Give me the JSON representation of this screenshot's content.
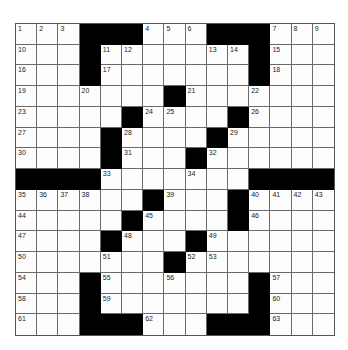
{
  "puzzle": {
    "rows": 15,
    "cols": 15,
    "block_color": "#000000",
    "cell_color": "#fdfdfd",
    "grid": [
      [
        "1",
        "2",
        "3",
        "#",
        "#",
        "#",
        "4",
        "5",
        "6",
        "#",
        "#",
        "#",
        "7",
        "8",
        "9"
      ],
      [
        "10",
        "",
        "",
        "#",
        "11",
        "12",
        "",
        "",
        "",
        "13",
        "14",
        "#",
        "15",
        "",
        ""
      ],
      [
        "16",
        "",
        "",
        "#",
        "17",
        "",
        "",
        "",
        "",
        "",
        "",
        "#",
        "18",
        "",
        ""
      ],
      [
        "19",
        "",
        "",
        "20",
        "",
        "",
        "",
        "#",
        "21",
        "",
        "",
        "22",
        "",
        "",
        ""
      ],
      [
        "23",
        "",
        "",
        "",
        "",
        "#",
        "24",
        "25",
        "",
        "",
        "#",
        "26",
        "",
        "",
        ""
      ],
      [
        "27",
        "",
        "",
        "",
        "#",
        "28",
        "",
        "",
        "",
        "#",
        "29",
        "",
        "",
        "",
        ""
      ],
      [
        "30",
        "",
        "",
        "",
        "#",
        "31",
        "",
        "",
        "#",
        "32",
        "",
        "",
        "",
        "",
        ""
      ],
      [
        "#",
        "#",
        "#",
        "#",
        "33",
        "",
        "",
        "",
        "34",
        "",
        "",
        "#",
        "#",
        "#",
        "#"
      ],
      [
        "35",
        "36",
        "37",
        "38",
        "",
        "",
        "#",
        "39",
        "",
        "",
        "#",
        "40",
        "41",
        "42",
        "43"
      ],
      [
        "44",
        "",
        "",
        "",
        "",
        "#",
        "45",
        "",
        "",
        "",
        "#",
        "46",
        "",
        "",
        ""
      ],
      [
        "47",
        "",
        "",
        "",
        "#",
        "48",
        "",
        "",
        "#",
        "49",
        "",
        "",
        "",
        "",
        ""
      ],
      [
        "50",
        "",
        "",
        "",
        "51",
        "",
        "",
        "#",
        "52",
        "53",
        "",
        "",
        "",
        "",
        ""
      ],
      [
        "54",
        "",
        "",
        "#",
        "55",
        "",
        "",
        "56",
        "",
        "",
        "",
        "#",
        "57",
        "",
        ""
      ],
      [
        "58",
        "",
        "",
        "#",
        "59",
        "",
        "",
        "",
        "",
        "",
        "",
        "#",
        "60",
        "",
        ""
      ],
      [
        "61",
        "",
        "",
        "#",
        "#",
        "#",
        "62",
        "",
        "",
        "#",
        "#",
        "#",
        "63",
        "",
        ""
      ]
    ]
  }
}
